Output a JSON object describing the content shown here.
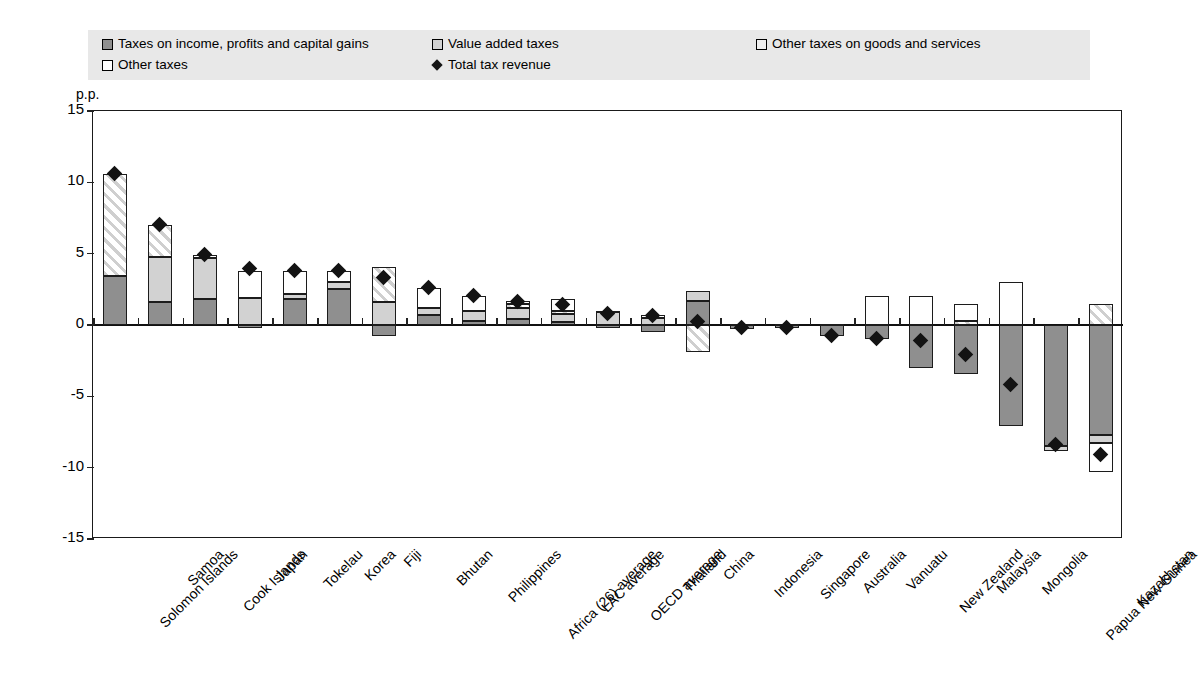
{
  "legend": {
    "items": [
      {
        "label": "Taxes on income, profits and capital gains",
        "swatch": "income-swatch",
        "type": "box"
      },
      {
        "label": "Value added taxes",
        "swatch": "vat-swatch",
        "type": "box"
      },
      {
        "label": "Other taxes on goods and services",
        "swatch": "goods-swatch",
        "type": "box"
      },
      {
        "label": "Other taxes",
        "swatch": "other-swatch",
        "type": "box"
      },
      {
        "label": "Total tax revenue",
        "swatch": "total-diamond-marker",
        "type": "diamond"
      }
    ]
  },
  "axis": {
    "y_title": "p.p.",
    "y_ticks": [
      "15",
      "10",
      "5",
      "0",
      "-5",
      "-10",
      "-15"
    ]
  },
  "chart_data": {
    "type": "bar",
    "title": "",
    "xlabel": "",
    "ylabel": "p.p.",
    "ylim": [
      -15,
      15
    ],
    "grid": false,
    "stacked": true,
    "legend_position": "top",
    "categories": [
      "Solomon Islands",
      "Samoa",
      "Cook Islands",
      "Japan",
      "Tokelau",
      "Korea",
      "Fiji",
      "Bhutan",
      "Philippines",
      "Africa (26) average",
      "LAC average",
      "OECD average",
      "Thailand",
      "China",
      "Indonesia",
      "Singapore",
      "Australia",
      "Vanuatu",
      "New Zealand",
      "Malaysia",
      "Mongolia",
      "Papua New Guinea",
      "Kazakhstan"
    ],
    "series": [
      {
        "name": "Taxes on income, profits and capital gains",
        "color": "#8f8f8f",
        "values": [
          3.4,
          1.6,
          1.8,
          -0.2,
          1.8,
          2.5,
          -0.8,
          0.7,
          0.3,
          0.4,
          0.2,
          -0.2,
          -0.5,
          1.7,
          -0.3,
          -0.2,
          -0.8,
          -1.0,
          -3.0,
          -3.4,
          -7.1,
          -8.5,
          -7.7
        ]
      },
      {
        "name": "Value added taxes",
        "color": "#d2d2d2",
        "values": [
          0.0,
          3.2,
          2.9,
          1.9,
          0.4,
          0.5,
          1.6,
          0.5,
          0.7,
          0.8,
          0.6,
          0.9,
          0.5,
          0.7,
          0.1,
          0.1,
          0.1,
          0.0,
          0.0,
          0.0,
          0.0,
          -0.3,
          -0.6
        ]
      },
      {
        "name": "Other taxes on goods and services",
        "color": "#efefef",
        "values": [
          7.2,
          2.2,
          0.0,
          0.0,
          0.0,
          0.0,
          2.5,
          0.0,
          0.0,
          0.3,
          0.2,
          0.0,
          0.0,
          -1.9,
          0.0,
          0.0,
          0.0,
          0.0,
          0.0,
          0.3,
          0.0,
          0.0,
          1.5
        ]
      },
      {
        "name": "Other taxes",
        "color": "#ffffff",
        "values": [
          0.0,
          0.0,
          0.2,
          1.9,
          1.6,
          0.8,
          0.0,
          1.4,
          1.0,
          0.2,
          0.8,
          0.1,
          0.2,
          0.0,
          0.0,
          0.0,
          0.0,
          2.0,
          2.0,
          1.2,
          3.0,
          0.0,
          -2.0
        ]
      }
    ],
    "marker_series": {
      "name": "Total tax revenue",
      "marker": "diamond",
      "color": "#131313",
      "values": [
        10.6,
        7.0,
        4.9,
        3.9,
        3.8,
        3.8,
        3.3,
        2.6,
        2.0,
        1.6,
        1.4,
        0.8,
        0.6,
        0.2,
        -0.2,
        -0.2,
        -0.8,
        -1.0,
        -1.1,
        -2.1,
        -4.2,
        -8.4,
        -9.1
      ]
    }
  }
}
